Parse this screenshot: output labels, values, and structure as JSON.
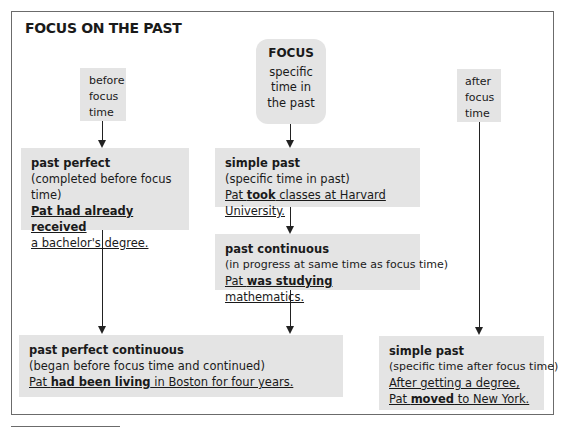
{
  "title": "FOCUS ON THE PAST",
  "time_boxes": {
    "before": {
      "lines": [
        "before",
        "focus",
        "time"
      ]
    },
    "focus": {
      "title": "FOCUS",
      "lines": [
        "specific",
        "time in",
        "the past"
      ]
    },
    "after": {
      "lines": [
        "after",
        "focus",
        "time"
      ]
    }
  },
  "tenses": {
    "past_perfect": {
      "name": "past perfect",
      "description": "(completed before focus time)",
      "example_line1_bold": "Pat had already received",
      "example_line2": "a bachelor's degree."
    },
    "simple_past": {
      "name": "simple past",
      "description": "(specific time in past)",
      "example_subject": "Pat ",
      "example_verb": "took",
      "example_rest": " classes at Harvard University."
    },
    "past_continuous": {
      "name": "past continuous",
      "description": "(in progress at same time as focus time)",
      "example_subject": "Pat ",
      "example_verb": "was studying",
      "example_rest": " mathematics."
    },
    "past_perfect_continuous": {
      "name": "past perfect continuous",
      "description": "(began before focus time and continued)",
      "example_subject": "Pat ",
      "example_verb": "had been living",
      "example_rest": " in Boston for four years."
    },
    "simple_past_after": {
      "name": "simple past",
      "description": "(specific time after focus time)",
      "example_line1": "After getting a degree,",
      "example_subject": "Pat ",
      "example_verb": "moved",
      "example_rest": " to New York."
    }
  },
  "colors": {
    "box_fill": "#e4e4e4",
    "frame": "#6b6b6b",
    "text": "#1a1a1a"
  }
}
